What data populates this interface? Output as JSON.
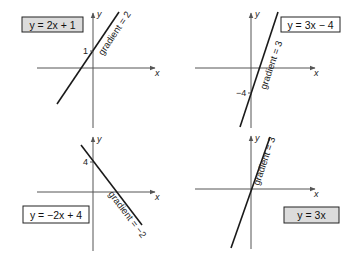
{
  "colors": {
    "background": "#ffffff",
    "axis": "#555555",
    "line": "#1a1a1a",
    "shaded_label_fill": "#dcdcdc",
    "plain_label_fill": "#ffffff"
  },
  "graphs": [
    {
      "equation": "y = 2x + 1",
      "gradient_label": "gradient = 2",
      "intercept_label": "1",
      "axis_x_label": "x",
      "axis_y_label": "y",
      "label_shaded": true
    },
    {
      "equation": "y = 3x − 4",
      "gradient_label": "gradient = 3",
      "intercept_label": "−4",
      "axis_x_label": "x",
      "axis_y_label": "y",
      "label_shaded": false
    },
    {
      "equation": "y = −2x + 4",
      "gradient_label": "gradient = −2",
      "intercept_label": "4",
      "axis_x_label": "x",
      "axis_y_label": "y",
      "label_shaded": false
    },
    {
      "equation": "y = 3x",
      "gradient_label": "gradient = 3",
      "intercept_label": "",
      "axis_x_label": "x",
      "axis_y_label": "y",
      "label_shaded": true
    }
  ]
}
